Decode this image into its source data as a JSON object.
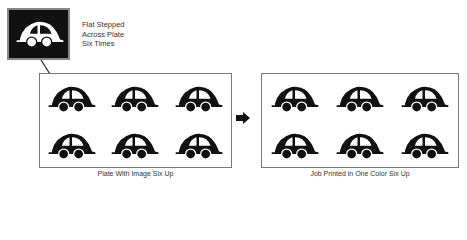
{
  "diagram": {
    "source_image": {
      "caption": "Flat Stepped\nAcross Plate\nSix Times",
      "icon": "car-icon",
      "colors": {
        "background": "#111111",
        "foreground": "#ffffff"
      }
    },
    "plate": {
      "label": "Plate With Image Six Up",
      "rows": 2,
      "columns": 3,
      "items": [
        "car-icon",
        "car-icon",
        "car-icon",
        "car-icon",
        "car-icon",
        "car-icon"
      ]
    },
    "printed_job": {
      "label": "Job Printed in One Color Six Up",
      "rows": 2,
      "columns": 3,
      "items": [
        "car-icon",
        "car-icon",
        "car-icon",
        "car-icon",
        "car-icon",
        "car-icon"
      ]
    },
    "connector_icon": "arrow-right-icon",
    "pointer_icon": "pointer-arrow-icon",
    "ink_color": "#111111"
  }
}
